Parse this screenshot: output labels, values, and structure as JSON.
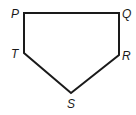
{
  "diagram": {
    "type": "pentagon",
    "stroke_color": "#1a1a1a",
    "stroke_width": 2,
    "vertices": [
      {
        "label": "P",
        "x": 24,
        "y": 13,
        "label_x": 11,
        "label_y": 18
      },
      {
        "label": "Q",
        "x": 119,
        "y": 13,
        "label_x": 122,
        "label_y": 18
      },
      {
        "label": "R",
        "x": 119,
        "y": 55,
        "label_x": 122,
        "label_y": 60
      },
      {
        "label": "S",
        "x": 71,
        "y": 93,
        "label_x": 67,
        "label_y": 108
      },
      {
        "label": "T",
        "x": 24,
        "y": 53,
        "label_x": 11,
        "label_y": 58
      }
    ],
    "edges": [
      "PQ",
      "QR",
      "RS",
      "ST",
      "TP"
    ]
  }
}
